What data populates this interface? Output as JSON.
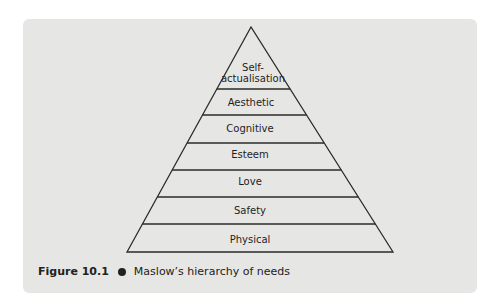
{
  "diagram": {
    "type": "pyramid",
    "levels_top_to_bottom": [
      {
        "label": "Self-\nactualisation",
        "line1": "Self-",
        "line2": "actualisation"
      },
      {
        "label": "Aesthetic"
      },
      {
        "label": "Cognitive"
      },
      {
        "label": "Esteem"
      },
      {
        "label": "Love"
      },
      {
        "label": "Safety"
      },
      {
        "label": "Physical"
      }
    ]
  },
  "caption": {
    "figure_number": "Figure 10.1",
    "text": "Maslow’s hierarchy of needs",
    "bullet_color": "#222222"
  },
  "colors": {
    "panel_background": "#e6e6e4",
    "line": "#2a2a2a",
    "text": "#1e1e1e"
  }
}
